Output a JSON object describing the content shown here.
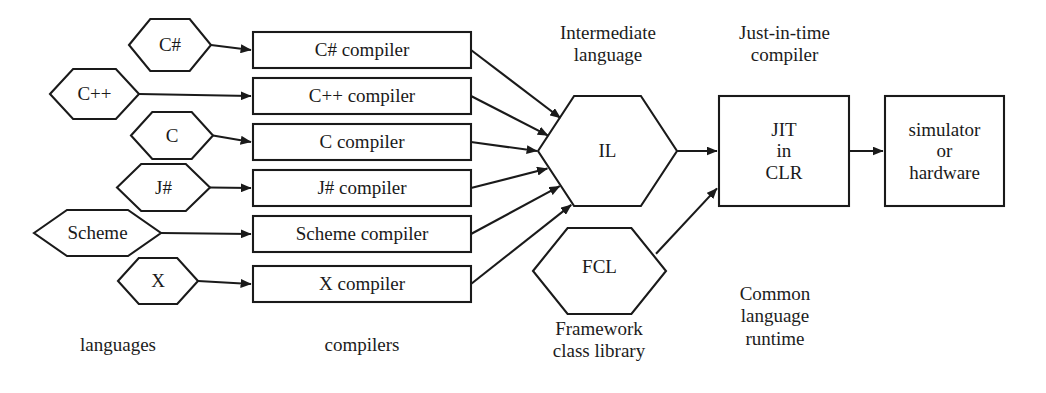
{
  "diagram": {
    "stroke_color": "#1a1a1a",
    "background_color": "#ffffff",
    "languages": [
      {
        "name": "C#",
        "shape": "hexagon",
        "x": 129,
        "y": 19,
        "w": 82,
        "h": 52
      },
      {
        "name": "C++",
        "shape": "hexagon",
        "x": 50,
        "y": 69,
        "w": 89,
        "h": 50
      },
      {
        "name": "C",
        "shape": "hexagon",
        "x": 131,
        "y": 112,
        "w": 82,
        "h": 47
      },
      {
        "name": "J#",
        "shape": "hexagon",
        "x": 117,
        "y": 164,
        "w": 93,
        "h": 47
      },
      {
        "name": "Scheme",
        "shape": "hexagon",
        "x": 34,
        "y": 210,
        "w": 127,
        "h": 46
      },
      {
        "name": "X",
        "shape": "hexagon",
        "x": 118,
        "y": 258,
        "w": 80,
        "h": 46
      }
    ],
    "compilers": [
      {
        "name": "C# compiler",
        "shape": "rect",
        "x": 253,
        "y": 32,
        "w": 218,
        "h": 36
      },
      {
        "name": "C++ compiler",
        "shape": "rect",
        "x": 253,
        "y": 78,
        "w": 218,
        "h": 36
      },
      {
        "name": "C compiler",
        "shape": "rect",
        "x": 253,
        "y": 124,
        "w": 218,
        "h": 36
      },
      {
        "name": "J# compiler",
        "shape": "rect",
        "x": 253,
        "y": 170,
        "w": 218,
        "h": 36
      },
      {
        "name": "Scheme compiler",
        "shape": "rect",
        "x": 253,
        "y": 216,
        "w": 218,
        "h": 36
      },
      {
        "name": "X compiler",
        "shape": "rect",
        "x": 253,
        "y": 266,
        "w": 218,
        "h": 36
      }
    ],
    "il_node": {
      "name": "IL",
      "shape": "hexagon",
      "x": 538,
      "y": 96,
      "w": 139,
      "h": 110
    },
    "fcl_node": {
      "name": "FCL",
      "shape": "hexagon",
      "x": 533,
      "y": 228,
      "w": 133,
      "h": 86
    },
    "jit_node": {
      "name": "JIT\nin\nCLR",
      "shape": "rect",
      "x": 719,
      "y": 96,
      "w": 130,
      "h": 110
    },
    "target_node": {
      "name": "simulator\nor\nhardware",
      "shape": "rect",
      "x": 885,
      "y": 96,
      "w": 119,
      "h": 110
    },
    "captions": [
      {
        "key": "intermediate-language",
        "text": "Intermediate\nlanguage",
        "x": 533,
        "y": 22,
        "w": 150
      },
      {
        "key": "just-in-time-compiler",
        "text": "Just-in-time\ncompiler",
        "x": 712,
        "y": 22,
        "w": 145
      },
      {
        "key": "languages",
        "text": "languages",
        "x": 48,
        "y": 334,
        "w": 140
      },
      {
        "key": "compilers",
        "text": "compilers",
        "x": 292,
        "y": 334,
        "w": 140
      },
      {
        "key": "framework-class-library",
        "text": "Framework\nclass library",
        "x": 524,
        "y": 318,
        "w": 150
      },
      {
        "key": "common-language-runtime",
        "text": "Common\nlanguage\nruntime",
        "x": 700,
        "y": 283,
        "w": 150
      }
    ],
    "edges": [
      {
        "key": "csharp-to-compiler",
        "from": "C#",
        "to": "C# compiler"
      },
      {
        "key": "cpp-to-compiler",
        "from": "C++",
        "to": "C++ compiler"
      },
      {
        "key": "c-to-compiler",
        "from": "C",
        "to": "C compiler"
      },
      {
        "key": "jsharp-to-compiler",
        "from": "J#",
        "to": "J# compiler"
      },
      {
        "key": "scheme-to-compiler",
        "from": "Scheme",
        "to": "Scheme compiler"
      },
      {
        "key": "x-to-compiler",
        "from": "X",
        "to": "X compiler"
      },
      {
        "key": "csharp-compiler-to-il",
        "from": "C# compiler",
        "to": "IL"
      },
      {
        "key": "cpp-compiler-to-il",
        "from": "C++ compiler",
        "to": "IL"
      },
      {
        "key": "c-compiler-to-il",
        "from": "C compiler",
        "to": "IL"
      },
      {
        "key": "jsharp-compiler-to-il",
        "from": "J# compiler",
        "to": "IL"
      },
      {
        "key": "scheme-compiler-to-il",
        "from": "Scheme compiler",
        "to": "IL"
      },
      {
        "key": "x-compiler-to-il",
        "from": "X compiler",
        "to": "IL"
      },
      {
        "key": "il-to-jit",
        "from": "IL",
        "to": "JIT in CLR"
      },
      {
        "key": "fcl-to-jit",
        "from": "FCL",
        "to": "JIT in CLR"
      },
      {
        "key": "jit-to-target",
        "from": "JIT in CLR",
        "to": "simulator or hardware"
      }
    ]
  }
}
